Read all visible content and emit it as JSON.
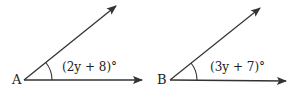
{
  "angles": [
    {
      "vertex": "A",
      "measure": "(2y + 8)°"
    },
    {
      "vertex": "B",
      "measure": "(3y + 7)°"
    }
  ],
  "colors": {
    "stroke": "#333333",
    "text": "#222222"
  }
}
